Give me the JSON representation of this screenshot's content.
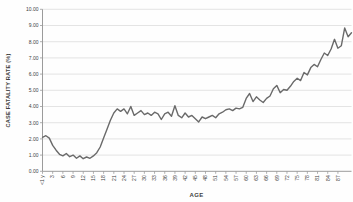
{
  "chart_data": {
    "type": "line",
    "title": "",
    "xlabel": "AGE",
    "ylabel": "CASE FATALITY RATE (%)",
    "ylim": [
      0,
      10
    ],
    "ytick_step": 1,
    "ytick_labels": [
      "0.00",
      "1.00",
      "2.00",
      "3.00",
      "4.00",
      "5.00",
      "6.00",
      "7.00",
      "8.00",
      "9.00",
      "10.00"
    ],
    "x_label_interval": 3,
    "x_tick_labels": [
      "<1 y",
      "3",
      "6",
      "9",
      "12",
      "15",
      "18",
      "21",
      "24",
      "27",
      "30",
      "33",
      "36",
      "39",
      "42",
      "45",
      "48",
      "51",
      "54",
      "57",
      "60",
      "63",
      "66",
      "69",
      "72",
      "75",
      "78",
      "81",
      "84",
      "87"
    ],
    "ages": [
      "<1 y",
      "1",
      "2",
      "3",
      "4",
      "5",
      "6",
      "7",
      "8",
      "9",
      "10",
      "11",
      "12",
      "13",
      "14",
      "15",
      "16",
      "17",
      "18",
      "19",
      "20",
      "21",
      "22",
      "23",
      "24",
      "25",
      "26",
      "27",
      "28",
      "29",
      "30",
      "31",
      "32",
      "33",
      "34",
      "35",
      "36",
      "37",
      "38",
      "39",
      "40",
      "41",
      "42",
      "43",
      "44",
      "45",
      "46",
      "47",
      "48",
      "49",
      "50",
      "51",
      "52",
      "53",
      "54",
      "55",
      "56",
      "57",
      "58",
      "59",
      "60",
      "61",
      "62",
      "63",
      "64",
      "65",
      "66",
      "67",
      "68",
      "69",
      "70",
      "71",
      "72",
      "73",
      "74",
      "75",
      "76",
      "77",
      "78",
      "79",
      "80",
      "81",
      "82",
      "83",
      "84",
      "85",
      "86",
      "87",
      "88",
      "89",
      "90",
      "91"
    ],
    "series": [
      {
        "name": "Case fatality rate (%)",
        "values": [
          2.1,
          2.2,
          2.05,
          1.6,
          1.3,
          1.05,
          0.95,
          1.1,
          0.9,
          1.0,
          0.8,
          0.95,
          0.78,
          0.88,
          0.8,
          0.95,
          1.15,
          1.5,
          2.05,
          2.6,
          3.15,
          3.6,
          3.85,
          3.7,
          3.85,
          3.55,
          4.0,
          3.45,
          3.6,
          3.75,
          3.5,
          3.6,
          3.45,
          3.65,
          3.55,
          3.2,
          3.55,
          3.65,
          3.4,
          4.05,
          3.45,
          3.3,
          3.6,
          3.35,
          3.45,
          3.25,
          3.05,
          3.35,
          3.25,
          3.35,
          3.45,
          3.3,
          3.55,
          3.65,
          3.8,
          3.85,
          3.75,
          3.9,
          3.85,
          3.95,
          4.5,
          4.8,
          4.3,
          4.6,
          4.4,
          4.25,
          4.5,
          4.65,
          5.1,
          5.3,
          4.85,
          5.05,
          5.0,
          5.25,
          5.55,
          5.75,
          5.6,
          6.1,
          5.95,
          6.4,
          6.6,
          6.45,
          6.9,
          7.3,
          7.15,
          7.55,
          8.15,
          7.6,
          7.75,
          8.85,
          8.3,
          8.55
        ]
      }
    ],
    "grid": "horizontal",
    "legend": "none",
    "colors": {
      "line": "#6a6a6a",
      "grid": "#d8d8d8",
      "axis": "#9b9b9b",
      "text": "#404040",
      "background": "#fefefe"
    }
  }
}
